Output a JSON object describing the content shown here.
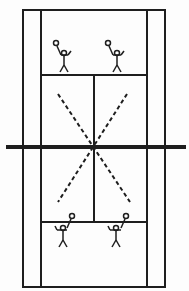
{
  "diagram": {
    "line_color": "#1e1e1e",
    "background": "#fdfdfd",
    "court": {
      "outer": {
        "x1": 23,
        "y1": 10,
        "x2": 165,
        "y2": 287
      },
      "singles_left_x": 41,
      "singles_right_x": 147,
      "top_service_y": 75,
      "bottom_service_y": 222,
      "center_x": 94,
      "net_y": 147
    },
    "players": [
      {
        "id": "top-left",
        "x": 64,
        "y": 58,
        "orientation": "down"
      },
      {
        "id": "top-right",
        "x": 117,
        "y": 58,
        "orientation": "down"
      },
      {
        "id": "bottom-left",
        "x": 63,
        "y": 236,
        "orientation": "up"
      },
      {
        "id": "bottom-right",
        "x": 116,
        "y": 236,
        "orientation": "up"
      }
    ],
    "diagonals": [
      {
        "from": [
          58,
          94
        ],
        "to": [
          130,
          202
        ]
      },
      {
        "from": [
          127,
          94
        ],
        "to": [
          58,
          202
        ]
      }
    ]
  }
}
